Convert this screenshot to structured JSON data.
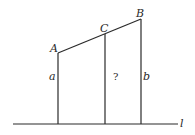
{
  "diagram": {
    "type": "geometry",
    "points": {
      "A": {
        "label": "A",
        "x": 58,
        "y": 53
      },
      "C": {
        "label": "C",
        "x": 105,
        "y": 37
      },
      "B": {
        "label": "B",
        "x": 141,
        "y": 19
      }
    },
    "baseline": {
      "label": "l",
      "y": 124,
      "x1": 13,
      "x2": 178
    },
    "segments": {
      "a": {
        "label": "a"
      },
      "unknown": {
        "label": "?"
      },
      "b": {
        "label": "b"
      }
    }
  }
}
